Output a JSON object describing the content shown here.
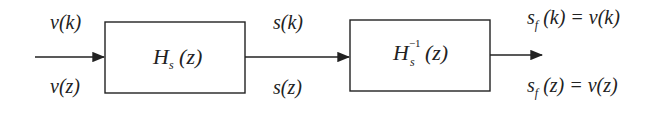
{
  "diagram": {
    "type": "block-diagram",
    "blocks": [
      {
        "id": "block-1",
        "symbol": "H",
        "subscript": "s",
        "superscript": "",
        "arg": "(z)"
      },
      {
        "id": "block-2",
        "symbol": "H",
        "subscript": "s",
        "superscript": "−1",
        "arg": "(z)"
      }
    ],
    "signals": {
      "input_top": "v(k)",
      "input_bottom": "v(z)",
      "mid_top": "s(k)",
      "mid_bottom": "s(z)",
      "output_top_sym": "s",
      "output_top_sub": "f",
      "output_top_rest": "(k) = v(k)",
      "output_bottom_sym": "s",
      "output_bottom_sub": "f",
      "output_bottom_rest": "(z) = v(z)"
    },
    "colors": {
      "stroke": "#222222",
      "background": "#ffffff"
    }
  }
}
